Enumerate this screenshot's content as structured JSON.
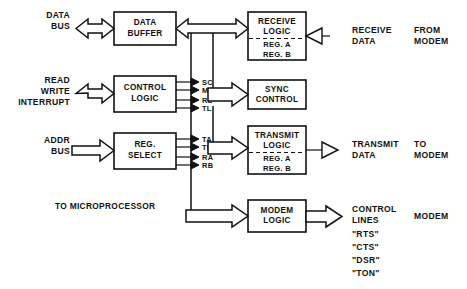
{
  "diagram": {
    "note": "TO MICROPROCESSOR",
    "colors": {
      "ink": "#111111",
      "paper": "#ffffff"
    }
  },
  "blocks": {
    "data_buffer": {
      "line1": "DATA",
      "line2": "BUFFER"
    },
    "control_logic": {
      "line1": "CONTROL",
      "line2": "LOGIC"
    },
    "reg_select": {
      "line1": "REG.",
      "line2": "SELECT"
    },
    "receive_logic": {
      "line1": "RECEIVE",
      "line2": "LOGIC",
      "reg_a": "REG. A",
      "reg_b": "REG. B"
    },
    "sync_control": {
      "line1": "SYNC",
      "line2": "CONTROL"
    },
    "transmit_logic": {
      "line1": "TRANSMIT",
      "line2": "LOGIC",
      "reg_a": "REG. A",
      "reg_b": "REG. B"
    },
    "modem_logic": {
      "line1": "MODEM",
      "line2": "LOGIC"
    }
  },
  "left_ports": {
    "data_bus": {
      "line1": "DATA",
      "line2": "BUS"
    },
    "read_write_interrupt": {
      "line1": "READ",
      "line2": "WRITE",
      "line3": "INTERRUPT"
    },
    "addr_bus": {
      "line1": "ADDR",
      "line2": "BUS"
    }
  },
  "control_signals": [
    "SC",
    "MC",
    "RL",
    "TL"
  ],
  "select_signals": [
    "TA",
    "TB",
    "RA",
    "RB"
  ],
  "right_ports": {
    "receive_data": {
      "line1": "RECEIVE",
      "line2": "DATA"
    },
    "transmit_data": {
      "line1": "TRANSMIT",
      "line2": "DATA"
    },
    "control_lines": {
      "line1": "CONTROL",
      "line2": "LINES",
      "signals": [
        "\"RTS\"",
        "\"CTS\"",
        "\"DSR\"",
        "\"TON\""
      ]
    }
  },
  "side_labels": {
    "from_modem": {
      "line1": "FROM",
      "line2": "MODEM"
    },
    "to_modem": {
      "line1": "TO",
      "line2": "MODEM"
    },
    "modem": {
      "line1": "MODEM"
    }
  }
}
